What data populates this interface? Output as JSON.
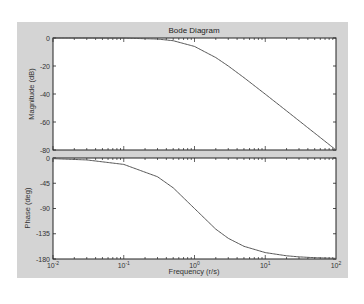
{
  "chart_data": {
    "type": "line",
    "title": "Bode Diagram",
    "xlabel": "Frequency (r/s)",
    "xscale": "log",
    "xlim": [
      0.01,
      100
    ],
    "x_ticks": [
      0.01,
      0.1,
      1,
      10,
      100
    ],
    "x_tick_labels": [
      {
        "base": "10",
        "exp": "-2"
      },
      {
        "base": "10",
        "exp": "-1"
      },
      {
        "base": "10",
        "exp": "0"
      },
      {
        "base": "10",
        "exp": "1"
      },
      {
        "base": "10",
        "exp": "2"
      }
    ],
    "grid": false,
    "subplots": [
      {
        "name": "magnitude",
        "ylabel": "Magnitude (dB)",
        "ylim": [
          -80,
          0
        ],
        "y_ticks": [
          0,
          -20,
          -40,
          -60,
          -80
        ],
        "y_tick_labels": [
          "0",
          "-20",
          "-40",
          "-60",
          "-80"
        ],
        "series": [
          {
            "name": "Magnitude",
            "x": [
              0.01,
              0.03,
              0.1,
              0.3,
              0.5,
              1,
              2,
              3,
              5,
              10,
              20,
              30,
              50,
              100
            ],
            "values": [
              0,
              -0.01,
              -0.09,
              -0.75,
              -1.94,
              -6.02,
              -13.98,
              -20.0,
              -28.3,
              -40.09,
              -52.05,
              -59.1,
              -67.96,
              -80.0
            ]
          }
        ]
      },
      {
        "name": "phase",
        "ylabel": "Phase (deg)",
        "ylim": [
          -180,
          0
        ],
        "y_ticks": [
          0,
          -45,
          -90,
          -135,
          -180
        ],
        "y_tick_labels": [
          "0",
          "-45",
          "-90",
          "-135",
          "-180"
        ],
        "series": [
          {
            "name": "Phase",
            "x": [
              0.01,
              0.03,
              0.1,
              0.3,
              0.5,
              1,
              2,
              3,
              5,
              10,
              20,
              30,
              50,
              100
            ],
            "values": [
              -1.15,
              -3.44,
              -11.42,
              -33.4,
              -53.13,
              -90.0,
              -126.87,
              -143.13,
              -157.38,
              -168.58,
              -174.28,
              -176.18,
              -177.71,
              -178.85
            ]
          }
        ]
      }
    ],
    "colors": {
      "frame": "#d4d4d4",
      "axes_bg": "#ffffff",
      "line": "#555555"
    }
  }
}
